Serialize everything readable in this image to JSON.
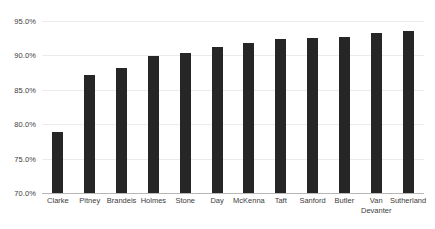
{
  "chart_data": {
    "type": "bar",
    "title": "",
    "subtitle": "",
    "xlabel": "",
    "ylabel": "",
    "categories": [
      "Clarke",
      "Pitney",
      "Brandeis",
      "Holmes",
      "Stone",
      "Day",
      "McKenna",
      "Taft",
      "Sanford",
      "Butler",
      "Van Devanter",
      "Sutherland"
    ],
    "category_lines": [
      [
        "Clarke"
      ],
      [
        "Pitney"
      ],
      [
        "Brandeis"
      ],
      [
        "Holmes"
      ],
      [
        "Stone"
      ],
      [
        "Day"
      ],
      [
        "McKenna"
      ],
      [
        "Taft"
      ],
      [
        "Sanford"
      ],
      [
        "Butler"
      ],
      [
        "Van",
        "Devanter"
      ],
      [
        "Sutherland"
      ]
    ],
    "values": [
      78.8,
      87.2,
      88.2,
      89.9,
      90.4,
      91.2,
      91.8,
      92.4,
      92.5,
      92.7,
      93.3,
      93.5
    ],
    "ylim": [
      70.0,
      95.0
    ],
    "ytick_values": [
      70.0,
      75.0,
      80.0,
      85.0,
      90.0,
      95.0
    ],
    "ytick_labels": [
      "70.0%",
      "75.0%",
      "80.0%",
      "85.0%",
      "90.0%",
      "95.0%"
    ],
    "grid": true,
    "grid_axis": "y",
    "legend": false,
    "legend_position": "none",
    "bar_color": "#262626",
    "grid_color": "#eceaea",
    "axis_color": "#b7b7b7",
    "label_color": "#3d3d3d",
    "background_color": "#ffffff"
  }
}
